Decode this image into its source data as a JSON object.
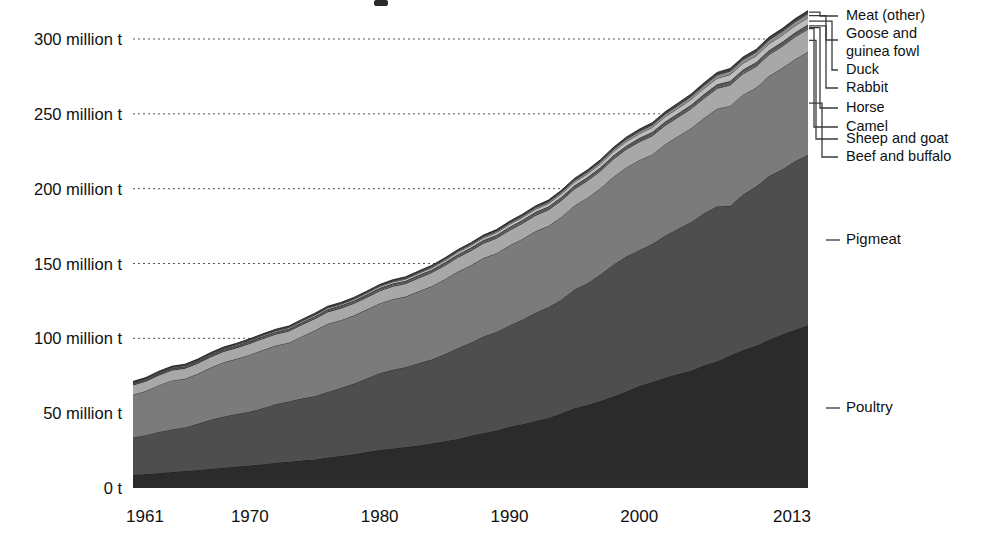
{
  "chart_data": {
    "type": "area",
    "stacked": true,
    "title": "",
    "xlabel": "",
    "ylabel": "",
    "unit": "t",
    "grid": true,
    "legend_position": "right-outside",
    "xlim": [
      1961,
      2013
    ],
    "ylim": [
      0,
      320
    ],
    "x_tick_labels": [
      "1961",
      "1970",
      "1980",
      "1990",
      "2000",
      "2013"
    ],
    "x_ticks": [
      1961,
      1970,
      1980,
      1990,
      2000,
      2013
    ],
    "y_tick_labels": [
      "0 t",
      "50 million t",
      "100 million t",
      "150 million t",
      "200 million t",
      "250 million t",
      "300 million t"
    ],
    "y_ticks": [
      0,
      50,
      100,
      150,
      200,
      250,
      300
    ],
    "x": [
      1961,
      1962,
      1963,
      1964,
      1965,
      1966,
      1967,
      1968,
      1969,
      1970,
      1971,
      1972,
      1973,
      1974,
      1975,
      1976,
      1977,
      1978,
      1979,
      1980,
      1981,
      1982,
      1983,
      1984,
      1985,
      1986,
      1987,
      1988,
      1989,
      1990,
      1991,
      1992,
      1993,
      1994,
      1995,
      1996,
      1997,
      1998,
      1999,
      2000,
      2001,
      2002,
      2003,
      2004,
      2005,
      2006,
      2007,
      2008,
      2009,
      2010,
      2011,
      2012,
      2013
    ],
    "series": [
      {
        "name": "Poultry",
        "color": "#2b2b2b",
        "values": [
          8.9,
          9.4,
          10.1,
          10.7,
          11.3,
          12.1,
          12.9,
          13.6,
          14.4,
          15.1,
          15.9,
          16.9,
          17.5,
          18.3,
          19.0,
          20.3,
          21.3,
          22.5,
          24.0,
          25.4,
          26.4,
          27.4,
          28.4,
          29.7,
          31.2,
          32.8,
          34.9,
          36.8,
          38.4,
          41.0,
          42.6,
          44.8,
          46.8,
          49.7,
          53.3,
          55.4,
          58.2,
          61.1,
          64.4,
          68.1,
          70.8,
          73.7,
          76.1,
          78.4,
          82.0,
          84.5,
          88.5,
          92.2,
          95.0,
          99.0,
          102.5,
          105.8,
          108.7
        ]
      },
      {
        "name": "Pigmeat",
        "color": "#4e4e4e",
        "values": [
          24.8,
          25.9,
          27.4,
          28.4,
          29.2,
          30.8,
          32.7,
          34.2,
          35.1,
          35.8,
          37.4,
          39.1,
          40.3,
          41.5,
          42.3,
          43.9,
          45.5,
          47.1,
          49.2,
          51.3,
          52.6,
          53.3,
          55.0,
          56.1,
          58.2,
          60.6,
          62.2,
          64.4,
          65.9,
          67.6,
          69.9,
          72.3,
          73.9,
          76.1,
          79.1,
          81.4,
          84.2,
          88.1,
          90.2,
          90.8,
          92.2,
          94.8,
          97.1,
          99.4,
          101.6,
          103.8,
          99.9,
          103.9,
          106.4,
          109.4,
          110.3,
          112.5,
          114.0
        ]
      },
      {
        "name": "Beef and buffalo",
        "color": "#7b7b7b",
        "values": [
          28.6,
          29.5,
          31.2,
          32.8,
          32.5,
          33.4,
          34.9,
          36.2,
          36.8,
          38.2,
          38.9,
          39.2,
          39.3,
          41.5,
          43.9,
          45.6,
          45.3,
          45.6,
          46.0,
          46.6,
          47.1,
          47.2,
          48.0,
          49.0,
          49.9,
          51.1,
          51.6,
          52.4,
          52.6,
          53.4,
          53.9,
          54.4,
          54.3,
          55.3,
          56.2,
          57.0,
          57.7,
          58.6,
          59.6,
          60.1,
          59.9,
          61.2,
          61.8,
          62.6,
          63.6,
          65.1,
          66.9,
          66.7,
          66.0,
          66.8,
          67.6,
          68.2,
          68.8
        ]
      },
      {
        "name": "Sheep and goat",
        "color": "#a8a8a8",
        "values": [
          6.5,
          6.6,
          6.8,
          6.9,
          7.0,
          7.1,
          7.2,
          7.3,
          7.4,
          7.5,
          7.6,
          7.6,
          7.7,
          7.8,
          7.9,
          7.9,
          8.0,
          8.1,
          8.2,
          8.4,
          8.6,
          8.7,
          8.9,
          9.1,
          9.3,
          9.5,
          9.7,
          9.9,
          10.0,
          10.2,
          10.4,
          10.6,
          10.8,
          11.0,
          11.2,
          11.4,
          11.6,
          11.9,
          12.1,
          12.3,
          12.4,
          12.6,
          12.8,
          13.0,
          13.3,
          13.6,
          13.9,
          14.0,
          14.2,
          14.4,
          14.6,
          14.9,
          15.1
        ]
      },
      {
        "name": "Camel",
        "color": "#6f6f6f",
        "values": [
          0.25,
          0.25,
          0.26,
          0.26,
          0.27,
          0.27,
          0.28,
          0.28,
          0.29,
          0.29,
          0.3,
          0.3,
          0.31,
          0.31,
          0.32,
          0.32,
          0.33,
          0.33,
          0.34,
          0.34,
          0.35,
          0.35,
          0.36,
          0.36,
          0.37,
          0.37,
          0.38,
          0.38,
          0.39,
          0.4,
          0.41,
          0.42,
          0.42,
          0.43,
          0.44,
          0.45,
          0.45,
          0.46,
          0.47,
          0.48,
          0.49,
          0.5,
          0.51,
          0.52,
          0.53,
          0.54,
          0.55,
          0.56,
          0.57,
          0.58,
          0.59,
          0.6,
          0.61
        ]
      },
      {
        "name": "Horse",
        "color": "#909090",
        "values": [
          0.5,
          0.51,
          0.52,
          0.53,
          0.54,
          0.55,
          0.56,
          0.57,
          0.58,
          0.59,
          0.6,
          0.6,
          0.61,
          0.62,
          0.63,
          0.64,
          0.64,
          0.65,
          0.66,
          0.67,
          0.68,
          0.68,
          0.69,
          0.7,
          0.71,
          0.72,
          0.72,
          0.73,
          0.74,
          0.75,
          0.74,
          0.73,
          0.72,
          0.72,
          0.71,
          0.71,
          0.7,
          0.7,
          0.7,
          0.71,
          0.71,
          0.72,
          0.72,
          0.73,
          0.73,
          0.74,
          0.74,
          0.75,
          0.75,
          0.76,
          0.76,
          0.77,
          0.77
        ]
      },
      {
        "name": "Rabbit",
        "color": "#555555",
        "values": [
          0.55,
          0.56,
          0.58,
          0.59,
          0.61,
          0.62,
          0.64,
          0.65,
          0.67,
          0.68,
          0.7,
          0.71,
          0.73,
          0.74,
          0.76,
          0.78,
          0.8,
          0.82,
          0.84,
          0.86,
          0.88,
          0.9,
          0.92,
          0.94,
          0.96,
          0.99,
          1.01,
          1.03,
          1.05,
          1.08,
          1.1,
          1.12,
          1.14,
          1.16,
          1.18,
          1.21,
          1.23,
          1.25,
          1.28,
          1.3,
          1.33,
          1.35,
          1.38,
          1.4,
          1.43,
          1.45,
          1.48,
          1.5,
          1.53,
          1.56,
          1.58,
          1.61,
          1.64
        ]
      },
      {
        "name": "Duck",
        "color": "#bdbdbd",
        "values": [
          0.35,
          0.37,
          0.39,
          0.41,
          0.43,
          0.46,
          0.48,
          0.51,
          0.54,
          0.57,
          0.6,
          0.63,
          0.67,
          0.7,
          0.74,
          0.78,
          0.83,
          0.87,
          0.92,
          0.97,
          1.03,
          1.09,
          1.15,
          1.21,
          1.28,
          1.35,
          1.43,
          1.51,
          1.59,
          1.68,
          1.78,
          1.88,
          1.98,
          2.09,
          2.21,
          2.34,
          2.47,
          2.6,
          2.75,
          2.9,
          3.06,
          3.23,
          3.41,
          3.6,
          3.8,
          4.01,
          4.23,
          4.2,
          4.28,
          4.36,
          4.45,
          4.53,
          4.61
        ]
      },
      {
        "name": "Goose and guinea fowl",
        "color": "#8c8c8c",
        "values": [
          0.2,
          0.21,
          0.22,
          0.23,
          0.24,
          0.25,
          0.26,
          0.28,
          0.29,
          0.31,
          0.32,
          0.34,
          0.36,
          0.38,
          0.4,
          0.42,
          0.45,
          0.47,
          0.5,
          0.53,
          0.56,
          0.59,
          0.62,
          0.66,
          0.7,
          0.74,
          0.78,
          0.82,
          0.87,
          0.92,
          0.97,
          1.03,
          1.09,
          1.15,
          1.22,
          1.29,
          1.37,
          1.45,
          1.53,
          1.62,
          1.72,
          1.82,
          1.93,
          2.04,
          2.16,
          2.29,
          2.42,
          2.47,
          2.53,
          2.58,
          2.64,
          2.69,
          2.75
        ]
      },
      {
        "name": "Meat (other)",
        "color": "#3f3f3f",
        "values": [
          0.55,
          0.56,
          0.58,
          0.59,
          0.61,
          0.62,
          0.64,
          0.65,
          0.67,
          0.69,
          0.7,
          0.72,
          0.74,
          0.76,
          0.78,
          0.8,
          0.82,
          0.84,
          0.86,
          0.88,
          0.9,
          0.92,
          0.95,
          0.97,
          0.99,
          1.02,
          1.04,
          1.07,
          1.1,
          1.12,
          1.15,
          1.18,
          1.21,
          1.24,
          1.27,
          1.3,
          1.34,
          1.37,
          1.4,
          1.44,
          1.48,
          1.51,
          1.55,
          1.59,
          1.63,
          1.67,
          1.71,
          1.75,
          1.8,
          1.84,
          1.89,
          1.93,
          1.98
        ]
      }
    ],
    "legend_entries": [
      {
        "label": "Meat (other)",
        "y": 16
      },
      {
        "label": "Goose and",
        "y": 34
      },
      {
        "label": "guinea fowl",
        "y": 52
      },
      {
        "label": "Duck",
        "y": 70
      },
      {
        "label": "Rabbit",
        "y": 88
      },
      {
        "label": "Horse",
        "y": 108
      },
      {
        "label": "Camel",
        "y": 127
      },
      {
        "label": "Sheep and goat",
        "y": 139
      },
      {
        "label": "Beef and buffalo",
        "y": 157
      },
      {
        "label": "Pigmeat",
        "y": 240
      },
      {
        "label": "Poultry",
        "y": 408
      }
    ]
  },
  "colors": {
    "background": "#ffffff",
    "text": "#111111",
    "gridline": "#555555",
    "leader": "#3a3a3a"
  }
}
